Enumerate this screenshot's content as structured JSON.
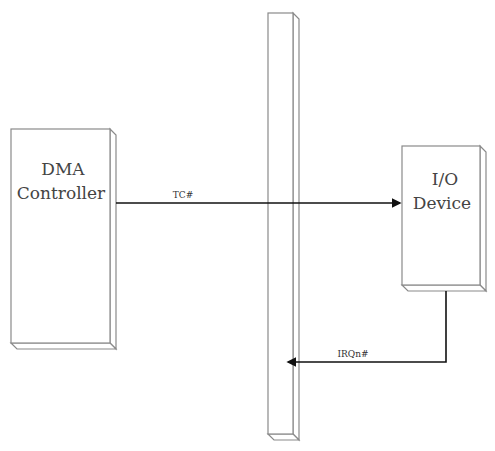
{
  "diagram": {
    "nodes": [
      {
        "id": "dma",
        "lines": [
          "DMA",
          "Controller"
        ]
      },
      {
        "id": "bus",
        "lines": []
      },
      {
        "id": "io",
        "lines": [
          "I/O",
          "Device"
        ]
      }
    ],
    "edges": [
      {
        "from": "dma",
        "to": "io",
        "label": "TC#"
      },
      {
        "from": "io",
        "to": "bus",
        "label": "IRQn#"
      }
    ]
  },
  "colors": {
    "outline": "#8a8a8a",
    "wire": "#111111",
    "text": "#444444"
  }
}
